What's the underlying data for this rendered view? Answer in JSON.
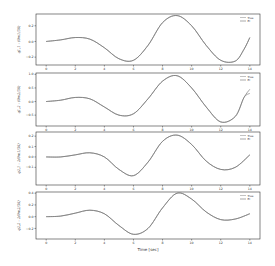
{
  "chart_data": [
    {
      "type": "line",
      "ylabel": "q_{1,1} - (θ_{m1}/36)",
      "xlim": [
        -0.7,
        14.7
      ],
      "ylim": [
        -0.3,
        0.35
      ],
      "yticks": [
        -0.2,
        0.0,
        0.2
      ],
      "xticks": [
        0,
        2,
        4,
        6,
        8,
        10,
        12,
        14
      ],
      "legend": [
        "True",
        "EI"
      ],
      "series": [
        {
          "name": "True",
          "x": [
            0,
            1,
            2,
            3,
            4,
            5,
            6,
            7,
            8,
            9,
            10,
            11,
            12,
            13,
            13.6,
            14
          ],
          "values": [
            0.0,
            0.02,
            0.05,
            0.03,
            -0.08,
            -0.22,
            -0.24,
            -0.05,
            0.24,
            0.33,
            0.2,
            -0.05,
            -0.24,
            -0.25,
            -0.1,
            0.05
          ]
        },
        {
          "name": "EI",
          "x": [
            0,
            1,
            2,
            3,
            4,
            5,
            6,
            7,
            8,
            9,
            10,
            11,
            12,
            13,
            13.6,
            14
          ],
          "values": [
            0.0,
            0.02,
            0.05,
            0.03,
            -0.08,
            -0.22,
            -0.24,
            -0.05,
            0.24,
            0.33,
            0.2,
            -0.05,
            -0.24,
            -0.25,
            -0.1,
            0.05
          ]
        }
      ]
    },
    {
      "type": "line",
      "ylabel": "q_{1,2} - (θ_{m2}/36)",
      "xlim": [
        -0.7,
        14.7
      ],
      "ylim": [
        -0.9,
        1.05
      ],
      "yticks": [
        -0.5,
        0.0,
        0.5,
        1.0
      ],
      "xticks": [
        0,
        2,
        4,
        6,
        8,
        10,
        12,
        14
      ],
      "legend": [
        "True",
        "EI"
      ],
      "series": [
        {
          "name": "True",
          "x": [
            0,
            1,
            2,
            3,
            4,
            5,
            6,
            7,
            8,
            9,
            10,
            11,
            12,
            13,
            13.6,
            14
          ],
          "values": [
            0.0,
            0.05,
            0.15,
            0.1,
            -0.2,
            -0.5,
            -0.45,
            0.1,
            0.75,
            0.95,
            0.5,
            -0.2,
            -0.75,
            -0.55,
            0.15,
            0.45
          ]
        },
        {
          "name": "EI",
          "x": [
            0,
            1,
            2,
            3,
            4,
            5,
            6,
            7,
            8,
            9,
            10,
            11,
            12,
            13,
            13.6,
            14
          ],
          "values": [
            0.0,
            0.05,
            0.15,
            0.1,
            -0.2,
            -0.5,
            -0.45,
            0.1,
            0.75,
            0.95,
            0.5,
            -0.2,
            -0.75,
            -0.55,
            0.15,
            0.3
          ]
        }
      ]
    },
    {
      "type": "line",
      "ylabel": "q_{2,1} - 2(θ_{m1}/36)",
      "xlim": [
        -0.7,
        14.7
      ],
      "ylim": [
        -0.27,
        0.24
      ],
      "yticks": [
        -0.1,
        0.0,
        0.1,
        0.2
      ],
      "xticks": [
        0,
        2,
        4,
        6,
        8,
        10,
        12,
        14
      ],
      "legend": [
        "True",
        "EI"
      ],
      "series": [
        {
          "name": "True",
          "x": [
            0,
            1,
            2,
            3,
            4,
            5,
            6,
            7,
            8,
            9,
            10,
            11,
            12,
            13,
            14
          ],
          "values": [
            0.0,
            0.0,
            0.02,
            0.04,
            0.0,
            -0.12,
            -0.18,
            -0.05,
            0.15,
            0.21,
            0.12,
            -0.04,
            -0.12,
            -0.1,
            0.02
          ]
        },
        {
          "name": "EI",
          "x": [
            0,
            1,
            2,
            3,
            4,
            5,
            6,
            7,
            8,
            9,
            10,
            11,
            12,
            13,
            14
          ],
          "values": [
            0.0,
            0.0,
            0.02,
            0.04,
            0.0,
            -0.12,
            -0.18,
            -0.05,
            0.15,
            0.21,
            0.12,
            -0.04,
            -0.12,
            -0.1,
            0.02
          ]
        }
      ]
    },
    {
      "type": "line",
      "ylabel": "q_{2,2} - 2(θ_{m2}/36)",
      "xlim": [
        -0.7,
        14.7
      ],
      "ylim": [
        -0.38,
        0.42
      ],
      "yticks": [
        -0.2,
        0.0,
        0.2,
        0.4
      ],
      "xticks": [
        0,
        2,
        4,
        6,
        8,
        10,
        12,
        14
      ],
      "xlabel": "Time [sec]",
      "legend": [
        "True",
        "EI"
      ],
      "series": [
        {
          "name": "True",
          "x": [
            0,
            1,
            2,
            3,
            4,
            5,
            6,
            7,
            8,
            9,
            10,
            11,
            12,
            13,
            14
          ],
          "values": [
            0.0,
            0.01,
            0.06,
            0.11,
            0.05,
            -0.15,
            -0.3,
            -0.2,
            0.15,
            0.4,
            0.3,
            0.08,
            -0.05,
            -0.04,
            0.05
          ]
        },
        {
          "name": "EI",
          "x": [
            0,
            1,
            2,
            3,
            4,
            5,
            6,
            7,
            8,
            9,
            10,
            11,
            12,
            13,
            14
          ],
          "values": [
            0.0,
            0.01,
            0.06,
            0.11,
            0.05,
            -0.15,
            -0.3,
            -0.2,
            0.15,
            0.4,
            0.3,
            0.08,
            -0.05,
            -0.04,
            0.05
          ]
        }
      ]
    }
  ],
  "labels": {
    "xlabel": "Time [sec]",
    "legend_true": "True",
    "legend_ei": "EI"
  }
}
